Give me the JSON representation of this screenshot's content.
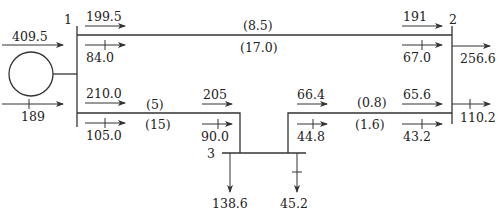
{
  "diagram": {
    "type": "power-flow-one-line",
    "buses": [
      {
        "id": "1",
        "label": "1"
      },
      {
        "id": "2",
        "label": "2"
      },
      {
        "id": "3",
        "label": "3"
      }
    ],
    "generator": {
      "bus": "1",
      "real_in": "409.5",
      "reactive_in": "189"
    },
    "lines": {
      "l12": {
        "p_from": "199.5",
        "q_from": "84.0",
        "p_to": "191",
        "q_to": "67.0",
        "p_loss": "(8.5)",
        "q_loss": "(17.0)"
      },
      "l13": {
        "p_from": "210.0",
        "q_from": "105.0",
        "p_to": "205",
        "q_to": "90.0",
        "p_loss": "(5)",
        "q_loss": "(15)"
      },
      "l32": {
        "p_from": "66.4",
        "q_from": "44.8",
        "p_to": "65.6",
        "q_to": "43.2",
        "p_loss": "(0.8)",
        "q_loss": "(1.6)"
      }
    },
    "loads": {
      "bus2": {
        "p": "256.6",
        "q": "110.2"
      },
      "bus3": {
        "p": "138.6",
        "q": "45.2"
      }
    }
  }
}
